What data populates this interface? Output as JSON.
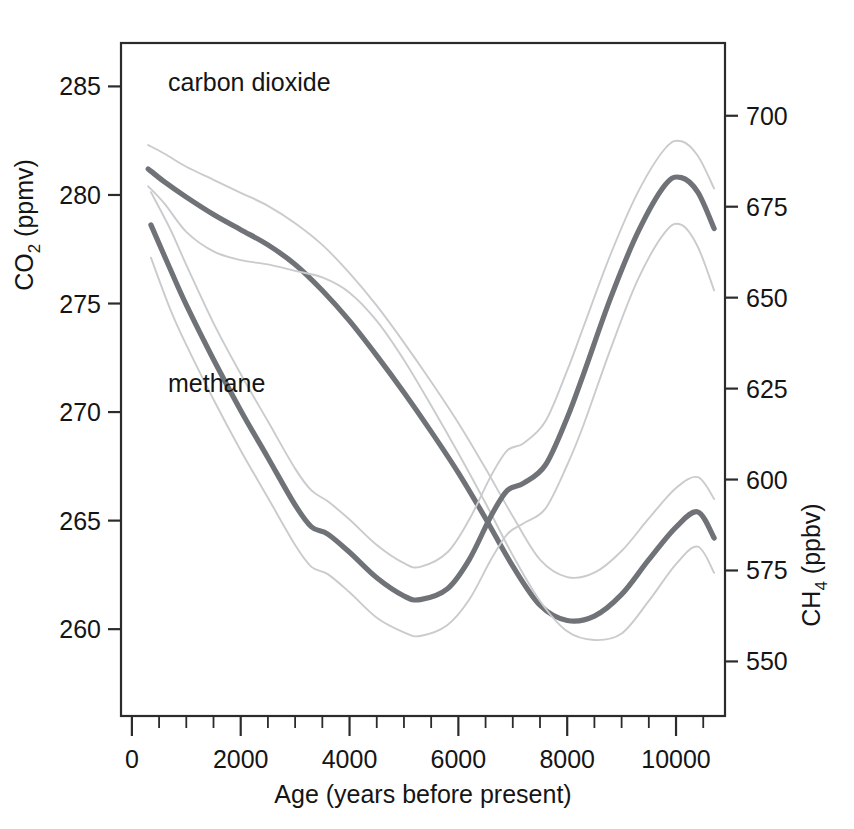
{
  "figure": {
    "background": "#ffffff",
    "frame_color": "#2b2b2b",
    "curve_color": "#6f7276",
    "band_color": "#c9cbcd"
  },
  "annotations": {
    "co2_label": "carbon dioxide",
    "ch4_label": "methane"
  },
  "axes": {
    "x": {
      "label": "Age (years before present)",
      "ticks": [
        "0",
        "2000",
        "4000",
        "6000",
        "8000",
        "10000"
      ],
      "tick_values": [
        0,
        2000,
        4000,
        6000,
        8000,
        10000
      ],
      "minor_step": 500,
      "range": [
        -200,
        10900
      ]
    },
    "y_left": {
      "label_main": "CO",
      "label_sub": "2",
      "label_unit": " (ppmv)",
      "label_full": "CO2 (ppmv)",
      "ticks": [
        "285",
        "280",
        "275",
        "270",
        "265",
        "260"
      ],
      "tick_values": [
        285,
        280,
        275,
        270,
        265,
        260
      ],
      "range": [
        256.0,
        287.0
      ]
    },
    "y_right": {
      "label_main": "CH",
      "label_sub": "4",
      "label_unit": " (ppbv)",
      "label_full": "CH4 (ppbv)",
      "ticks": [
        "700",
        "675",
        "650",
        "625",
        "600",
        "575",
        "550"
      ],
      "tick_values": [
        700,
        675,
        650,
        625,
        600,
        575,
        550
      ],
      "range": [
        535.0,
        720.0
      ]
    }
  },
  "chart_data": {
    "type": "line",
    "title": "",
    "xlabel": "Age (years before present)",
    "ylabel": "CO2 (ppmv)",
    "ylabel_right": "CH4 (ppbv)",
    "xlim": [
      -200,
      10900
    ],
    "ylim": [
      256.0,
      287.0
    ],
    "ylim_right": [
      535.0,
      720.0
    ],
    "grid": false,
    "legend": "inline annotations",
    "series": [
      {
        "name": "carbon dioxide",
        "axis": "left",
        "unit": "ppmv",
        "x": [
          300,
          600,
          1000,
          1500,
          2000,
          2500,
          3000,
          3500,
          4000,
          4500,
          5000,
          5500,
          6000,
          6500,
          7000,
          7500,
          8000,
          8500,
          9000,
          9500,
          10000,
          10400,
          10700
        ],
        "y": [
          281.2,
          280.6,
          279.9,
          279.1,
          278.4,
          277.7,
          276.8,
          275.6,
          274.2,
          272.6,
          270.9,
          269.1,
          267.2,
          265.1,
          262.9,
          261.1,
          260.4,
          260.6,
          261.6,
          263.2,
          264.7,
          265.4,
          264.2
        ]
      },
      {
        "name": "carbon dioxide upper band",
        "axis": "left",
        "unit": "ppmv",
        "x": [
          300,
          600,
          1000,
          1500,
          2000,
          2500,
          3000,
          3500,
          4000,
          4500,
          5000,
          5500,
          6000,
          6500,
          7000,
          7500,
          8000,
          8500,
          9000,
          9500,
          10000,
          10400,
          10700
        ],
        "y": [
          282.3,
          281.9,
          281.3,
          280.7,
          280.1,
          279.5,
          278.7,
          277.7,
          276.4,
          274.9,
          273.2,
          271.4,
          269.5,
          267.4,
          265.2,
          263.2,
          262.4,
          262.6,
          263.6,
          265.1,
          266.5,
          267.0,
          266.0
        ]
      },
      {
        "name": "carbon dioxide lower band",
        "axis": "left",
        "unit": "ppmv",
        "x": [
          300,
          600,
          1000,
          1500,
          2000,
          2500,
          3000,
          3500,
          4000,
          4500,
          5000,
          5500,
          6000,
          6500,
          7000,
          7500,
          8000,
          8500,
          9000,
          9500,
          10000,
          10400,
          10700
        ],
        "y": [
          280.4,
          279.6,
          278.3,
          277.4,
          277.0,
          276.8,
          276.5,
          276.2,
          275.5,
          274.2,
          272.4,
          270.3,
          268.1,
          265.8,
          263.4,
          261.3,
          259.9,
          259.5,
          259.8,
          261.3,
          263.0,
          263.8,
          262.6
        ]
      },
      {
        "name": "methane",
        "axis": "right",
        "unit": "ppbv",
        "x": [
          350,
          700,
          1000,
          1500,
          2000,
          2500,
          3000,
          3300,
          3600,
          4000,
          4500,
          5000,
          5300,
          5800,
          6200,
          6600,
          6900,
          7200,
          7600,
          8000,
          8300,
          8800,
          9300,
          9800,
          10100,
          10400,
          10700
        ],
        "y": [
          670.0,
          658.0,
          648.0,
          633.0,
          619.0,
          606.0,
          593.0,
          587.0,
          585.0,
          580.0,
          573.0,
          568.0,
          567.0,
          570.0,
          578.0,
          590.0,
          597.0,
          599.0,
          604.0,
          617.0,
          629.0,
          650.0,
          668.0,
          681.0,
          683.0,
          679.0,
          669.0
        ]
      },
      {
        "name": "methane upper band",
        "axis": "right",
        "unit": "ppbv",
        "x": [
          350,
          700,
          1000,
          1500,
          2000,
          2500,
          3000,
          3300,
          3600,
          4000,
          4500,
          5000,
          5300,
          5800,
          6200,
          6600,
          6900,
          7200,
          7600,
          8000,
          8300,
          8800,
          9300,
          9800,
          10100,
          10400,
          10700
        ],
        "y": [
          679.0,
          669.0,
          659.0,
          643.0,
          629.0,
          616.0,
          603.0,
          597.0,
          594.0,
          589.0,
          582.0,
          577.0,
          576.0,
          580.0,
          589.0,
          601.0,
          608.0,
          610.0,
          616.0,
          630.0,
          642.0,
          662.0,
          679.0,
          691.0,
          693.0,
          689.0,
          680.0
        ]
      },
      {
        "name": "methane lower band",
        "axis": "right",
        "unit": "ppbv",
        "x": [
          350,
          700,
          1000,
          1500,
          2000,
          2500,
          3000,
          3300,
          3600,
          4000,
          4500,
          5000,
          5300,
          5800,
          6200,
          6600,
          6900,
          7200,
          7600,
          8000,
          8300,
          8800,
          9300,
          9800,
          10100,
          10400,
          10700
        ],
        "y": [
          661.0,
          647.0,
          637.0,
          622.0,
          608.0,
          595.0,
          582.0,
          576.0,
          574.0,
          569.0,
          562.0,
          558.0,
          557.0,
          560.0,
          567.0,
          578.0,
          585.0,
          588.0,
          592.0,
          604.0,
          615.0,
          636.0,
          655.0,
          668.0,
          670.0,
          664.0,
          652.0
        ]
      }
    ]
  }
}
